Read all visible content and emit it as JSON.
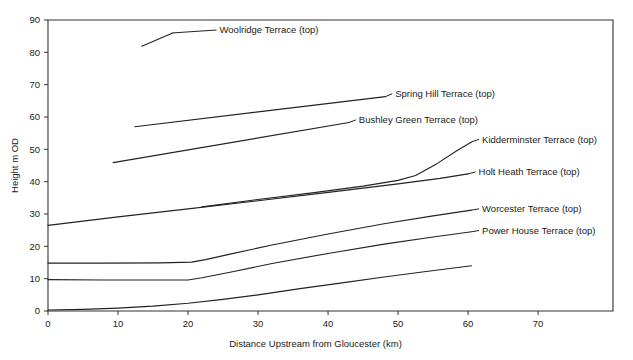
{
  "chart_data": {
    "type": "line",
    "title": "",
    "xlabel": "Distance Upstream from Gloucester  (km)",
    "ylabel": "Height m OD",
    "xlim": [
      0,
      80.7
    ],
    "ylim": [
      0,
      90
    ],
    "xticks": [
      0,
      10,
      20,
      30,
      40,
      50,
      60,
      70
    ],
    "yticks": [
      0,
      10,
      20,
      30,
      40,
      50,
      60,
      70,
      80,
      90
    ],
    "xtick_labels": [
      "0",
      "10",
      "20",
      "30",
      "40",
      "50",
      "60",
      "70"
    ],
    "ytick_labels": [
      "0",
      "10",
      "20",
      "30",
      "40",
      "50",
      "60",
      "70",
      "80",
      "90"
    ],
    "grid": false,
    "legend": "inline-labels-right",
    "series": [
      {
        "name": "Woolridge Terrace (top)",
        "label": "Woolridge Terrace (top)",
        "x": [
          13.4,
          17.8
        ],
        "y": [
          81.9,
          86.0
        ],
        "label_x": 24.5,
        "label_y": 86.9
      },
      {
        "name": "Spring Hill Terrace (top)",
        "label": "Spring Hill Terrace (top)",
        "x": [
          12.4,
          48.2
        ],
        "y": [
          57.0,
          66.3
        ],
        "label_x": 49.6,
        "label_y": 67.2
      },
      {
        "name": "Bushley Green Terrace (top)",
        "label": "Bushley Green Terrace (top)",
        "x": [
          9.3,
          43.0
        ],
        "y": [
          45.9,
          58.3
        ],
        "label_x": 44.4,
        "label_y": 59.1
      },
      {
        "name": "Kidderminster Terrace (top)",
        "label": "Kidderminster Terrace (top)",
        "x": [
          22.0,
          30.0,
          38.0,
          45.0,
          50.0,
          52.5,
          55.5,
          58.5,
          60.5
        ],
        "y": [
          32.2,
          34.5,
          36.6,
          38.6,
          40.4,
          41.9,
          45.5,
          49.7,
          52.3
        ],
        "label_x": 62.0,
        "label_y": 53.1
      },
      {
        "name": "Holt Heath Terrace (top)",
        "label": "Holt Heath Terrace (top)",
        "x": [
          0.0,
          10.0,
          20.0,
          30.0,
          40.0,
          50.0,
          56.0,
          60.0
        ],
        "y": [
          26.5,
          29.1,
          31.6,
          34.1,
          36.7,
          39.3,
          41.0,
          42.4
        ],
        "label_x": 61.5,
        "label_y": 43.0
      },
      {
        "name": "Worcester Terrace (top)",
        "label": "Worcester Terrace (top)",
        "x": [
          0.0,
          8.0,
          16.0,
          20.5,
          22.5,
          26.0,
          32.0,
          40.0,
          48.0,
          55.0,
          60.5
        ],
        "y": [
          14.8,
          14.8,
          14.9,
          15.1,
          15.9,
          17.6,
          20.4,
          23.8,
          27.0,
          29.4,
          31.2
        ],
        "label_x": 62.0,
        "label_y": 31.6
      },
      {
        "name": "Power House Terrace (top)",
        "label": "Power House Terrace (top)",
        "x": [
          0.0,
          8.0,
          16.0,
          20.0,
          22.0,
          26.0,
          32.0,
          40.0,
          48.0,
          55.0,
          60.5
        ],
        "y": [
          9.7,
          9.6,
          9.6,
          9.6,
          10.3,
          12.0,
          14.7,
          17.8,
          20.7,
          22.9,
          24.5
        ],
        "label_x": 62.0,
        "label_y": 24.9
      },
      {
        "name": "Unlabelled basal terrace",
        "label": "",
        "x": [
          0.0,
          5.0,
          10.0,
          15.0,
          20.0,
          25.0,
          30.0,
          36.0,
          42.0,
          48.0,
          54.0,
          60.5
        ],
        "y": [
          0.3,
          0.5,
          0.9,
          1.5,
          2.4,
          3.6,
          5.0,
          6.9,
          8.7,
          10.5,
          12.2,
          14.0
        ],
        "label_x": null,
        "label_y": null
      }
    ],
    "colors": {
      "line": "#222222",
      "axis": "#333333",
      "text": "#1a1a1a",
      "background": "#ffffff"
    }
  }
}
